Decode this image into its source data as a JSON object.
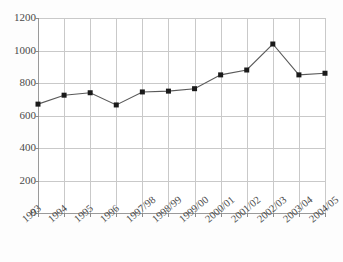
{
  "chart_data": {
    "type": "line",
    "title": "",
    "xlabel": "",
    "ylabel": "",
    "ylim": [
      0,
      1200
    ],
    "ytick_values": [
      0,
      200,
      400,
      600,
      800,
      1000,
      1200
    ],
    "ytick_labels": [
      "0",
      "200",
      "400",
      "600",
      "800",
      "1000",
      "1200"
    ],
    "grid": true,
    "legend": "none",
    "categories": [
      "1993",
      "1994",
      "1995",
      "1996",
      "1997/98",
      "1998/99",
      "1999/00",
      "2000/01",
      "2001/02",
      "2002/03",
      "2003/04",
      "2004/05"
    ],
    "series": [
      {
        "name": "",
        "marker": "square",
        "marker_color": "#1a1a1a",
        "line_color": "#5a5a5a",
        "values": [
          670,
          725,
          740,
          665,
          745,
          750,
          765,
          850,
          880,
          1040,
          850,
          860
        ]
      }
    ]
  },
  "colors": {
    "grid": "#c9c9c9",
    "axis": "#9a9a9a",
    "marker": "#1a1a1a",
    "line": "#5a5a5a",
    "background": "#fdfdfd",
    "plot_background": "#ffffff",
    "tick_text": "#4a4a4a"
  }
}
